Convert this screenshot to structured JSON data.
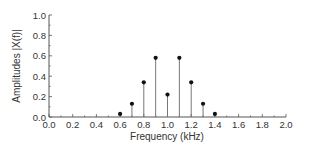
{
  "chart_data": {
    "type": "stem",
    "title": "",
    "xlabel": "Frequency (kHz)",
    "ylabel": "Amplitudes  |X(f)|",
    "xlim": [
      0.0,
      2.0
    ],
    "ylim": [
      0.0,
      1.0
    ],
    "xticks": [
      "0.0",
      "0.2",
      "0.4",
      "0.6",
      "0.8",
      "1.0",
      "1.2",
      "1.4",
      "1.6",
      "1.8",
      "2.0"
    ],
    "yticks": [
      "0.0",
      "0.2",
      "0.4",
      "0.6",
      "0.8",
      "1.0"
    ],
    "grid": false,
    "x": [
      0.6,
      0.7,
      0.8,
      0.9,
      1.0,
      1.1,
      1.2,
      1.3,
      1.4
    ],
    "values": [
      0.03,
      0.13,
      0.34,
      0.58,
      0.22,
      0.58,
      0.34,
      0.13,
      0.03
    ]
  },
  "colors": {
    "axis": "#555555",
    "stem": "#777777",
    "marker": "#111111",
    "text": "#333333"
  }
}
